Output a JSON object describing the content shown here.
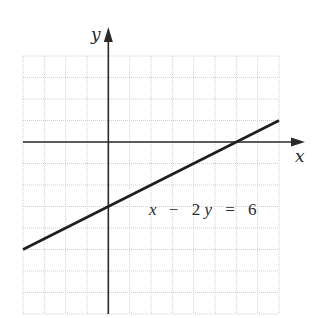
{
  "chart_data": {
    "type": "line",
    "title": "",
    "xlabel": "x",
    "ylabel": "y",
    "xlim": [
      -4,
      8
    ],
    "ylim": [
      -8,
      4
    ],
    "grid": true,
    "grid_step": 1,
    "tick_labels_shown": false,
    "series": [
      {
        "name": "x − 2y = 6",
        "equation": "x - 2y = 6",
        "slope": 0.5,
        "y_intercept": -3,
        "x_intercept": 6,
        "x": [
          -4,
          8
        ],
        "y": [
          -5,
          1
        ]
      }
    ],
    "annotations": [
      {
        "text": "x − 2y = 6",
        "x": 1.9,
        "y": -3.2
      }
    ],
    "legend": null
  },
  "labels": {
    "x_axis": "x",
    "y_axis": "y",
    "equation_parts": {
      "x": "x",
      "minus": "−",
      "two": "2",
      "y": "y",
      "equals": "=",
      "six": "6"
    }
  },
  "colors": {
    "grid": "#cfcfcf",
    "axis": "#2a2a2a",
    "line": "#1e1e1e",
    "text": "#2a2a2a"
  }
}
